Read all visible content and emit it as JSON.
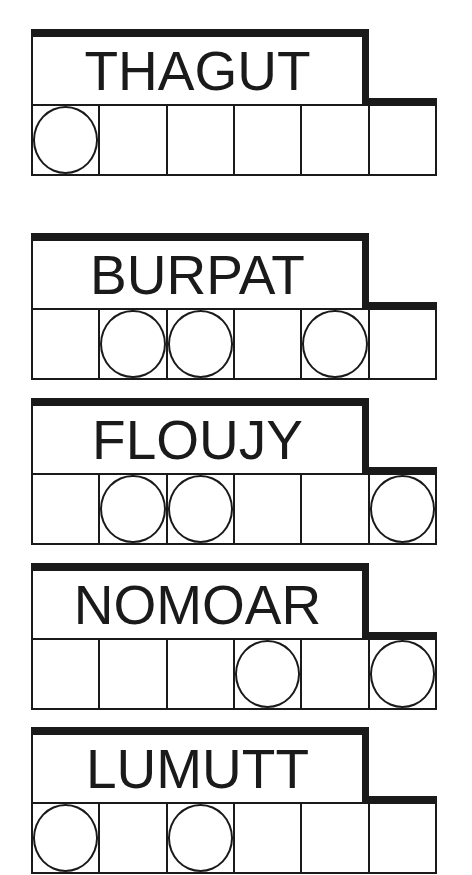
{
  "puzzles": [
    {
      "scrambled_word": "THAGUT",
      "cell_count": 6,
      "circled_cells": [
        1
      ]
    },
    {
      "scrambled_word": "BURPAT",
      "cell_count": 6,
      "circled_cells": [
        2,
        3,
        5
      ]
    },
    {
      "scrambled_word": "FLOUJY",
      "cell_count": 6,
      "circled_cells": [
        2,
        3,
        6
      ]
    },
    {
      "scrambled_word": "NOMOAR",
      "cell_count": 6,
      "circled_cells": [
        4,
        6
      ]
    },
    {
      "scrambled_word": "LUMUTT",
      "cell_count": 6,
      "circled_cells": [
        1,
        3
      ]
    }
  ],
  "colors": {
    "ink": "#1a1a1a",
    "background": "#ffffff"
  }
}
